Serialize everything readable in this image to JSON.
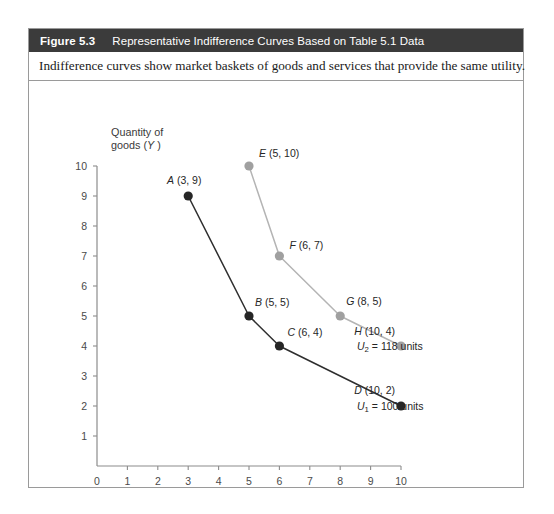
{
  "figure": {
    "number": "Figure 5.3",
    "title": "Representative Indifference Curves Based on Table 5.1 Data",
    "caption": "Indifference curves show market baskets of goods and services that provide the same utility.",
    "header_bg": "#3b3b3b",
    "border_color": "#9a9a9a"
  },
  "chart_data": {
    "type": "line",
    "title": "Representative Indifference Curves Based on Table 5.1 Data",
    "xlabel": "Quantity of services (X)",
    "ylabel": "Quantity of goods (Y)",
    "ylabel_line1": "Quantity of",
    "ylabel_line2": "goods (Y)",
    "xlim": [
      0,
      10
    ],
    "ylim": [
      0,
      10
    ],
    "xticks": [
      0,
      1,
      2,
      3,
      4,
      5,
      6,
      7,
      8,
      9,
      10
    ],
    "yticks": [
      1,
      2,
      3,
      4,
      5,
      6,
      7,
      8,
      9,
      10
    ],
    "grid": false,
    "legend": "none",
    "series": [
      {
        "name": "U1",
        "curve_label": "U1 = 100 units",
        "curve_label_base": "U",
        "curve_label_sub": "1",
        "curve_label_rest": " = 100 units",
        "color": "#2e2e2e",
        "marker_color": "#262626",
        "x": [
          3,
          5,
          6,
          10
        ],
        "y": [
          9,
          5,
          4,
          2
        ],
        "points": [
          {
            "id": "A",
            "x": 3,
            "y": 9,
            "label": "A (3, 9)",
            "letter": "A",
            "coords": " (3, 9)"
          },
          {
            "id": "B",
            "x": 5,
            "y": 5,
            "label": "B (5, 5)",
            "letter": "B",
            "coords": " (5, 5)"
          },
          {
            "id": "C",
            "x": 6,
            "y": 4,
            "label": "C (6, 4)",
            "letter": "C",
            "coords": " (6, 4)"
          },
          {
            "id": "D",
            "x": 10,
            "y": 2,
            "label": "D (10, 2)",
            "letter": "D",
            "coords": " (10, 2)"
          }
        ]
      },
      {
        "name": "U2",
        "curve_label": "U2 = 118 units",
        "curve_label_base": "U",
        "curve_label_sub": "2",
        "curve_label_rest": " = 118 units",
        "color": "#b4b4b4",
        "marker_color": "#a0a0a0",
        "x": [
          5,
          6,
          8,
          10
        ],
        "y": [
          10,
          7,
          5,
          4
        ],
        "points": [
          {
            "id": "E",
            "x": 5,
            "y": 10,
            "label": "E (5, 10)",
            "letter": "E",
            "coords": " (5, 10)"
          },
          {
            "id": "F",
            "x": 6,
            "y": 7,
            "label": "F (6, 7)",
            "letter": "F",
            "coords": " (6, 7)"
          },
          {
            "id": "G",
            "x": 8,
            "y": 5,
            "label": "G (8, 5)",
            "letter": "G",
            "coords": " (8, 5)"
          },
          {
            "id": "H",
            "x": 10,
            "y": 4,
            "label": "H (10, 4)",
            "letter": "H",
            "coords": " (10, 4)"
          }
        ]
      }
    ]
  }
}
